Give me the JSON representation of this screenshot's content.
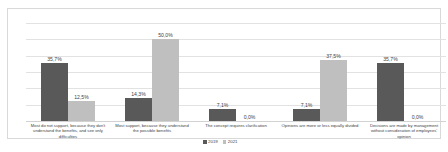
{
  "chart_data": {
    "type": "bar",
    "title": "",
    "subtitle": "",
    "xlabel": "",
    "ylabel": "",
    "ylim": [
      0,
      60
    ],
    "grid": true,
    "gridlines": [
      0,
      10,
      20,
      30,
      40,
      50,
      60
    ],
    "legend_position": "bottom-center",
    "categories": [
      "Most do not support, because they don't understand the benefits, and see only difficulties",
      "Most support, because they understand the possible benefits",
      "The concept requires clarification",
      "Opinions are more or less equally divided",
      "Decisions are made by management without consideration of employees' opinion"
    ],
    "series": [
      {
        "name": "2019",
        "color": "#595959",
        "values": [
          35.7,
          14.3,
          7.1,
          7.1,
          35.7
        ],
        "labels": [
          "35,7%",
          "14,3%",
          "7,1%",
          "7,1%",
          "35,7%"
        ]
      },
      {
        "name": "2021",
        "color": "#bfbfbf",
        "values": [
          12.5,
          50.0,
          0.0,
          37.5,
          0.0
        ],
        "labels": [
          "12,5%",
          "50,0%",
          "0,0%",
          "37,5%",
          "0,0%"
        ]
      }
    ]
  },
  "colors": {
    "series_2019": "#595959",
    "series_2021": "#bfbfbf",
    "gridline": "#e2e2e2",
    "frame": "#d9d9d9",
    "text": "#3f3f3f",
    "background": "#ffffff"
  }
}
